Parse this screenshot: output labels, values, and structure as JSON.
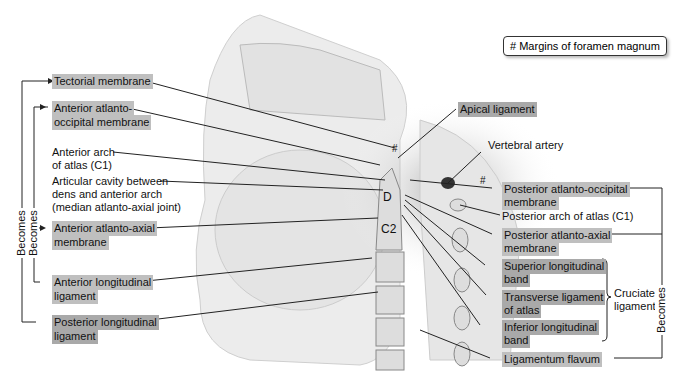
{
  "legend": {
    "symbol": "#",
    "text": "Margins of foramen magnum"
  },
  "labels_left": {
    "tectorial": "Tectorial membrane",
    "ant_occ_1": "Anterior atlanto-",
    "ant_occ_2": "occipital membrane",
    "arch_1": "Anterior arch",
    "arch_2": "of atlas (C1)",
    "cavity_1": "Articular cavity between",
    "cavity_2": "dens and anterior arch",
    "cavity_3": "(median atlanto-axial joint)",
    "ant_axial_1": "Anterior atlanto-axial",
    "ant_axial_2": "membrane",
    "ant_long_1": "Anterior longitudinal",
    "ant_long_2": "ligament",
    "post_long_1": "Posterior longitudinal",
    "post_long_2": "ligament"
  },
  "labels_right": {
    "apical": "Apical ligament",
    "vertebral": "Vertebral artery",
    "post_occ_1": "Posterior atlanto-occipital",
    "post_occ_2": "membrane",
    "post_arch": "Posterior arch of atlas (C1)",
    "post_axial_1": "Posterior atlanto-axial",
    "post_axial_2": "membrane",
    "sup_long_1": "Superior longitudinal",
    "sup_long_2": "band",
    "transverse_1": "Transverse ligament",
    "transverse_2": "of atlas",
    "inf_long_1": "Inferior longitudinal",
    "inf_long_2": "band",
    "flavum": "Ligamentum flavum",
    "cruciate_1": "Cruciate",
    "cruciate_2": "ligament"
  },
  "becomes": {
    "outer_left": "Becomes",
    "inner_left": "Becomes",
    "right": "Becomes"
  },
  "inner_marks": {
    "dens": "D",
    "axis": "C2",
    "margin_top": "#",
    "margin_back": "#"
  }
}
